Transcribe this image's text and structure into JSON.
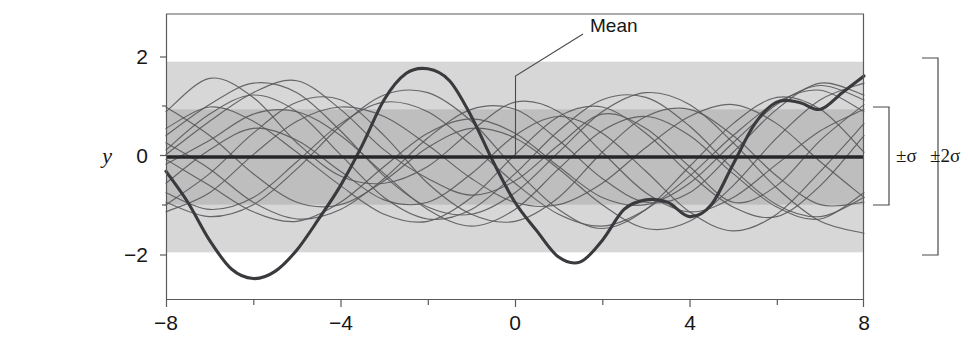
{
  "chart_data": {
    "type": "line",
    "title": "",
    "subtitle": "",
    "xlabel": "",
    "ylabel": "y",
    "xlim": [
      -8,
      8
    ],
    "ylim": [
      -3,
      3
    ],
    "grid": false,
    "legend_position": "none",
    "x_ticks_major": [
      -8,
      -4,
      0,
      4,
      8
    ],
    "x_ticks_major_labels": [
      "−8",
      "−4",
      "0",
      "4",
      "8"
    ],
    "x_ticks_minor": [
      -6,
      -2,
      2,
      6
    ],
    "y_ticks_major": [
      2,
      0,
      -2
    ],
    "y_ticks_major_labels": [
      "2",
      "0",
      "−2"
    ],
    "y_ticks_minor": [
      1,
      -1
    ],
    "bands": [
      {
        "name": "plus-minus-2-sigma",
        "lower": -2,
        "upper": 2,
        "color": "#d7d7d7"
      },
      {
        "name": "plus-minus-1-sigma",
        "lower": -1,
        "upper": 1,
        "color": "#bebebe"
      }
    ],
    "mean": {
      "name": "Mean",
      "value": 0
    },
    "series": [
      {
        "name": "mean-line",
        "emphasis": "mean",
        "x": [
          -8,
          8
        ],
        "values": [
          0,
          0
        ]
      },
      {
        "name": "highlighted-sample",
        "emphasis": "bold",
        "x": [
          -8.0,
          -7.5,
          -7.0,
          -6.5,
          -6.0,
          -5.5,
          -5.0,
          -4.5,
          -4.0,
          -3.5,
          -3.0,
          -2.5,
          -2.0,
          -1.5,
          -1.0,
          -0.5,
          0.0,
          0.5,
          1.0,
          1.5,
          2.0,
          2.5,
          3.0,
          3.5,
          4.0,
          4.5,
          5.0,
          5.5,
          6.0,
          6.5,
          7.0,
          7.5,
          8.0
        ],
        "values": [
          -0.3,
          -0.95,
          -1.75,
          -2.35,
          -2.55,
          -2.4,
          -1.95,
          -1.3,
          -0.6,
          0.25,
          1.2,
          1.75,
          1.85,
          1.6,
          0.85,
          -0.1,
          -0.95,
          -1.55,
          -2.1,
          -2.2,
          -1.75,
          -1.1,
          -0.9,
          -0.95,
          -1.25,
          -1.0,
          -0.15,
          0.7,
          1.15,
          1.15,
          1.0,
          1.35,
          1.7
        ]
      },
      {
        "name": "sample-1",
        "x": [
          -8.0,
          -7.0,
          -6.0,
          -5.0,
          -4.0,
          -3.0,
          -2.0,
          -1.0,
          0.0,
          1.0,
          2.0,
          3.0,
          4.0,
          5.0,
          6.0,
          7.0,
          8.0
        ],
        "values": [
          0.05,
          0.75,
          1.35,
          1.6,
          1.0,
          0.15,
          -0.45,
          -0.8,
          -0.5,
          0.25,
          0.9,
          0.6,
          -0.2,
          -0.95,
          -0.6,
          0.35,
          1.1
        ]
      },
      {
        "name": "sample-2",
        "x": [
          -8.0,
          -7.0,
          -6.0,
          -5.0,
          -4.0,
          -3.0,
          -2.0,
          -1.0,
          0.0,
          1.0,
          2.0,
          3.0,
          4.0,
          5.0,
          6.0,
          7.0,
          8.0
        ],
        "values": [
          -1.0,
          -0.35,
          0.5,
          1.15,
          1.2,
          0.45,
          -0.55,
          -1.2,
          -1.35,
          -0.85,
          0.1,
          0.85,
          1.0,
          0.45,
          -0.4,
          -1.0,
          -0.95
        ]
      },
      {
        "name": "sample-3",
        "x": [
          -8.0,
          -7.0,
          -6.0,
          -5.0,
          -4.0,
          -3.0,
          -2.0,
          -1.0,
          0.0,
          1.0,
          2.0,
          3.0,
          4.0,
          5.0,
          6.0,
          7.0,
          8.0
        ],
        "values": [
          0.6,
          1.05,
          0.75,
          0.1,
          -0.6,
          -1.2,
          -1.35,
          -0.85,
          0.05,
          0.85,
          1.05,
          0.5,
          -0.35,
          -1.05,
          -1.25,
          -0.6,
          0.45
        ]
      },
      {
        "name": "sample-4",
        "x": [
          -8.0,
          -7.0,
          -6.0,
          -5.0,
          -4.0,
          -3.0,
          -2.0,
          -1.0,
          0.0,
          1.0,
          2.0,
          3.0,
          4.0,
          5.0,
          6.0,
          7.0,
          8.0
        ],
        "values": [
          -0.95,
          -1.25,
          -1.0,
          -0.25,
          0.65,
          1.3,
          1.35,
          0.75,
          -0.25,
          -1.1,
          -1.5,
          -1.1,
          -0.2,
          0.7,
          1.25,
          1.0,
          0.1
        ]
      },
      {
        "name": "sample-5",
        "x": [
          -8.0,
          -7.0,
          -6.0,
          -5.0,
          -4.0,
          -3.0,
          -2.0,
          -1.0,
          0.0,
          1.0,
          2.0,
          3.0,
          4.0,
          5.0,
          6.0,
          7.0,
          8.0
        ],
        "values": [
          0.95,
          1.65,
          1.25,
          0.3,
          -0.4,
          -0.55,
          -0.2,
          0.55,
          1.15,
          0.95,
          0.1,
          -0.75,
          -1.15,
          -0.85,
          -0.15,
          0.55,
          1.0
        ]
      },
      {
        "name": "sample-6",
        "x": [
          -8.0,
          -7.0,
          -6.0,
          -5.0,
          -4.0,
          -3.0,
          -2.0,
          -1.0,
          0.0,
          1.0,
          2.0,
          3.0,
          4.0,
          5.0,
          6.0,
          7.0,
          8.0
        ],
        "values": [
          -0.15,
          0.35,
          0.9,
          0.95,
          0.45,
          -0.35,
          -1.1,
          -1.45,
          -1.1,
          -0.25,
          0.55,
          0.85,
          0.45,
          -0.35,
          -1.05,
          -1.3,
          -0.75
        ]
      },
      {
        "name": "sample-7",
        "x": [
          -8.0,
          -7.0,
          -6.0,
          -5.0,
          -4.0,
          -3.0,
          -2.0,
          -1.0,
          0.0,
          1.0,
          2.0,
          3.0,
          4.0,
          5.0,
          6.0,
          7.0,
          8.0
        ],
        "values": [
          0.3,
          -0.25,
          -0.95,
          -1.3,
          -1.1,
          -0.45,
          0.4,
          1.0,
          1.0,
          0.35,
          -0.45,
          -0.95,
          -0.75,
          0.1,
          1.0,
          1.55,
          1.3
        ]
      },
      {
        "name": "sample-8",
        "x": [
          -8.0,
          -7.0,
          -6.0,
          -5.0,
          -4.0,
          -3.0,
          -2.0,
          -1.0,
          0.0,
          1.0,
          2.0,
          3.0,
          4.0,
          5.0,
          6.0,
          7.0,
          8.0
        ],
        "values": [
          -0.55,
          0.15,
          0.6,
          0.35,
          -0.3,
          -0.9,
          -0.95,
          -0.35,
          0.45,
          0.85,
          0.5,
          -0.3,
          -1.15,
          -1.55,
          -1.2,
          -0.3,
          0.7
        ]
      },
      {
        "name": "sample-9",
        "x": [
          -8.0,
          -7.0,
          -6.0,
          -5.0,
          -4.0,
          -3.0,
          -2.0,
          -1.0,
          0.0,
          1.0,
          2.0,
          3.0,
          4.0,
          5.0,
          6.0,
          7.0,
          8.0
        ],
        "values": [
          1.05,
          0.45,
          -0.35,
          -0.95,
          -1.0,
          -0.5,
          0.2,
          0.6,
          0.4,
          -0.25,
          -1.0,
          -1.5,
          -1.35,
          -0.6,
          0.4,
          1.2,
          1.55
        ]
      },
      {
        "name": "sample-10",
        "x": [
          -8.0,
          -7.0,
          -6.0,
          -5.0,
          -4.0,
          -3.0,
          -2.0,
          -1.0,
          0.0,
          1.0,
          2.0,
          3.0,
          4.0,
          5.0,
          6.0,
          7.0,
          8.0
        ],
        "values": [
          -1.15,
          -0.75,
          0.05,
          0.75,
          1.05,
          0.85,
          0.25,
          -0.45,
          -0.95,
          -1.0,
          -0.55,
          0.2,
          0.85,
          1.1,
          0.7,
          -0.1,
          -0.85
        ]
      },
      {
        "name": "sample-11",
        "x": [
          -8.0,
          -7.0,
          -6.0,
          -5.0,
          -4.0,
          -3.0,
          -2.0,
          -1.0,
          0.0,
          1.0,
          2.0,
          3.0,
          4.0,
          5.0,
          6.0,
          7.0,
          8.0
        ],
        "values": [
          0.45,
          1.1,
          1.55,
          1.35,
          0.55,
          -0.4,
          -1.05,
          -1.2,
          -0.75,
          0.1,
          0.95,
          1.35,
          1.1,
          0.3,
          -0.65,
          -1.35,
          -1.6
        ]
      },
      {
        "name": "sample-12",
        "x": [
          -8.0,
          -7.0,
          -6.0,
          -5.0,
          -4.0,
          -3.0,
          -2.0,
          -1.0,
          0.0,
          1.0,
          2.0,
          3.0,
          4.0,
          5.0,
          6.0,
          7.0,
          8.0
        ],
        "values": [
          -0.05,
          -0.6,
          -1.15,
          -1.35,
          -0.95,
          -0.2,
          0.5,
          0.8,
          0.5,
          -0.2,
          -0.85,
          -1.0,
          -0.55,
          0.3,
          1.1,
          1.5,
          1.2
        ]
      },
      {
        "name": "sample-13",
        "x": [
          -8.0,
          -7.0,
          -6.0,
          -5.0,
          -4.0,
          -3.0,
          -2.0,
          -1.0,
          0.0,
          1.0,
          2.0,
          3.0,
          4.0,
          5.0,
          6.0,
          7.0,
          8.0
        ],
        "values": [
          -0.75,
          -1.1,
          -0.85,
          -0.1,
          0.7,
          1.15,
          0.95,
          0.25,
          -0.55,
          -1.2,
          -1.45,
          -1.1,
          -0.4,
          0.45,
          1.15,
          1.4,
          0.95
        ]
      },
      {
        "name": "sample-14",
        "x": [
          -8.0,
          -7.0,
          -6.0,
          -5.0,
          -4.0,
          -3.0,
          -2.0,
          -1.0,
          0.0,
          1.0,
          2.0,
          3.0,
          4.0,
          5.0,
          6.0,
          7.0,
          8.0
        ],
        "values": [
          0.15,
          0.9,
          1.3,
          0.95,
          0.05,
          -0.85,
          -1.3,
          -1.1,
          -0.35,
          0.55,
          1.2,
          1.25,
          0.65,
          -0.25,
          -1.0,
          -1.25,
          -0.85
        ]
      }
    ],
    "annotations": [
      {
        "name": "mean-callout",
        "text": "Mean",
        "target_x": 0,
        "target_y": 0
      },
      {
        "name": "one-sigma-bracket",
        "text": "±σ",
        "from": -1,
        "to": 1
      },
      {
        "name": "two-sigma-bracket",
        "text": "±2σ",
        "from": -2,
        "to": 2
      }
    ]
  },
  "axes": {
    "y_name": "y",
    "y_labels": [
      "2",
      "0",
      "−2"
    ],
    "x_labels": [
      "−8",
      "−4",
      "0",
      "4",
      "8"
    ]
  },
  "labels": {
    "mean": "Mean",
    "one_sigma": "±σ",
    "two_sigma": "±2σ"
  },
  "colors": {
    "band_outer": "#d8d8d8",
    "band_inner": "#bfbfbf",
    "mean_line": "#27272b",
    "sample_line": "#56565a",
    "highlight_line": "#3a3a3e",
    "axis": "#5a5a5a",
    "text": "#171717"
  }
}
